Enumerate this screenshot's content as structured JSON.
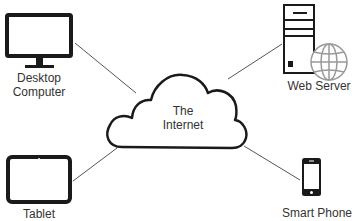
{
  "diagram": {
    "center": {
      "label_line1": "The",
      "label_line2": "Internet"
    },
    "nodes": {
      "desktop": {
        "label_line1": "Desktop",
        "label_line2": "Computer"
      },
      "web_server": {
        "label": "Web Server"
      },
      "tablet": {
        "label": "Tablet"
      },
      "smart_phone": {
        "label": "Smart Phone"
      }
    },
    "colors": {
      "stroke": "#1a1a1a",
      "line": "#555555",
      "globe": "#999999",
      "text": "#333333"
    }
  }
}
